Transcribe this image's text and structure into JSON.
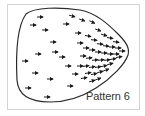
{
  "figure": {
    "label": "Pattern 6",
    "colors": {
      "frame": "#d4d4d4",
      "outline": "#2a2a2a",
      "arrow": "#1a1a1a",
      "label": "#333333"
    },
    "boundary_shape": "rounded-triangle-pointing-right",
    "arrow_direction": "right",
    "arrows": [
      [
        40,
        17,
        0
      ],
      [
        33,
        25,
        0
      ],
      [
        45,
        30,
        0
      ],
      [
        72,
        16,
        15
      ],
      [
        66,
        24,
        0
      ],
      [
        82,
        20,
        20
      ],
      [
        78,
        33,
        0
      ],
      [
        53,
        42,
        0
      ],
      [
        38,
        54,
        0
      ],
      [
        55,
        52,
        0
      ],
      [
        25,
        61,
        0
      ],
      [
        35,
        73,
        0
      ],
      [
        50,
        79,
        0
      ],
      [
        28,
        88,
        0
      ],
      [
        47,
        97,
        0
      ],
      [
        80,
        43,
        0
      ],
      [
        92,
        22,
        25
      ],
      [
        98,
        30,
        20
      ],
      [
        104,
        35,
        15
      ],
      [
        110,
        38,
        10
      ],
      [
        116,
        42,
        8
      ],
      [
        88,
        36,
        10
      ],
      [
        94,
        40,
        5
      ],
      [
        100,
        44,
        5
      ],
      [
        106,
        46,
        5
      ],
      [
        112,
        47,
        0
      ],
      [
        118,
        48,
        0
      ],
      [
        86,
        48,
        0
      ],
      [
        92,
        50,
        0
      ],
      [
        98,
        52,
        0
      ],
      [
        104,
        53,
        0
      ],
      [
        110,
        54,
        0
      ],
      [
        116,
        54,
        0
      ],
      [
        122,
        51,
        0
      ],
      [
        83,
        56,
        0
      ],
      [
        89,
        58,
        -5
      ],
      [
        95,
        60,
        -5
      ],
      [
        101,
        60,
        -5
      ],
      [
        107,
        60,
        -8
      ],
      [
        113,
        59,
        -10
      ],
      [
        119,
        57,
        -10
      ],
      [
        62,
        57,
        0
      ],
      [
        68,
        66,
        0
      ],
      [
        80,
        66,
        0
      ],
      [
        86,
        66,
        -8
      ],
      [
        92,
        67,
        -10
      ],
      [
        98,
        67,
        -10
      ],
      [
        104,
        66,
        -12
      ],
      [
        110,
        64,
        -15
      ],
      [
        75,
        74,
        0
      ],
      [
        88,
        73,
        -10
      ],
      [
        94,
        74,
        -12
      ],
      [
        100,
        72,
        -15
      ],
      [
        106,
        70,
        -20
      ],
      [
        70,
        86,
        0
      ],
      [
        92,
        81,
        -15
      ],
      [
        98,
        79,
        -20
      ],
      [
        84,
        78,
        -10
      ]
    ]
  }
}
